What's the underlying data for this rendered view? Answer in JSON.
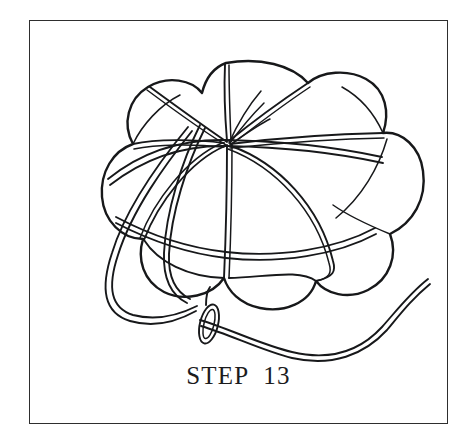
{
  "page": {
    "background_color": "#ffffff",
    "width": 471,
    "height": 446
  },
  "frame": {
    "name": "illustration-border",
    "border_color": "#2e2e2e",
    "border_width_px": 1.6,
    "x": 29,
    "y": 20,
    "width": 419,
    "height": 404
  },
  "illustration": {
    "title": "gathered fabric ball with needle and thread",
    "style": "black-and-white line drawing",
    "line_color": "#17181a",
    "fill_color": "#ffffff",
    "elements": [
      {
        "name": "petal-lobe-outer-contour",
        "description": "scalloped outer silhouette of the gathered fabric ball, about seven rounded lobes"
      },
      {
        "name": "gathering-seam-lines",
        "description": "paired seam lines radiating from the top center gathering point to the lobe edges"
      },
      {
        "name": "center-gather-point",
        "description": "point at upper middle where all seam lines and thread ends converge"
      },
      {
        "name": "thread-loop-left",
        "description": "doubled thread looping around the left side and under the ball"
      },
      {
        "name": "needle-knot-loop",
        "description": "small elongated loop knot at lower middle where the thread passes through itself"
      },
      {
        "name": "thread-tail",
        "description": "long doubled S-curved thread tail trailing off to the right"
      },
      {
        "name": "loose-thread-ends",
        "description": "short loose thread strands sticking up at the center gather point"
      }
    ]
  },
  "caption": {
    "name": "step-caption",
    "text": "STEP  13",
    "step_number": 13,
    "label_word": "STEP",
    "color": "#1b1b1d",
    "font_size_px": 25
  }
}
